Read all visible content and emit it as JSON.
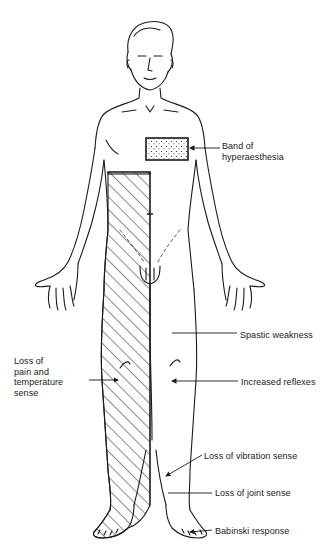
{
  "figure": {
    "regions": [
      {
        "name": "band-of-hyperaesthesia",
        "pattern": "stippled",
        "side": "left"
      },
      {
        "name": "sensory-loss-region",
        "pattern": "hatched",
        "side": "right"
      }
    ]
  },
  "labels": {
    "band": "Band of\nhyperaesthesia",
    "pain": "Loss of\npain and\ntemperature\nsense",
    "spastic": "Spastic weakness",
    "reflexes": "Increased reflexes",
    "vibration": "Loss of vibration sense",
    "joint": "Loss of joint sense",
    "babinski": "Babinski response"
  },
  "colors": {
    "line": "#1a1a1a",
    "background": "#ffffff"
  }
}
